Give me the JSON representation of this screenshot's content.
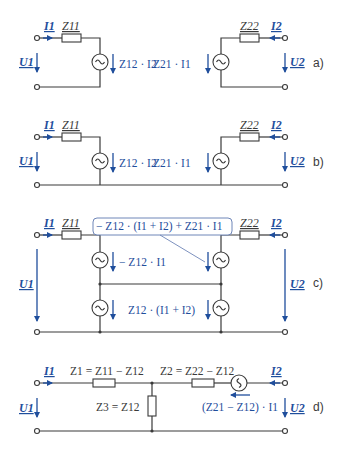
{
  "figure": {
    "colors": {
      "wire": "#3a3a3a",
      "accent": "#1f4e9c",
      "callout_border": "#6f86b8"
    },
    "parts": [
      {
        "id": "a",
        "label": "a)",
        "I1": "I1",
        "I2": "I2",
        "U1": "U1",
        "U2": "U2",
        "Z11": "Z11",
        "Z22": "Z22",
        "left_source": "Z12 · I2",
        "right_source": "Z21 · I1"
      },
      {
        "id": "b",
        "label": "b)",
        "I1": "I1",
        "I2": "I2",
        "U1": "U1",
        "U2": "U2",
        "Z11": "Z11",
        "Z22": "Z22",
        "left_source": "Z12 · I2",
        "right_source": "Z21 · I1"
      },
      {
        "id": "c",
        "label": "c)",
        "I1": "I1",
        "I2": "I2",
        "U1": "U1",
        "U2": "U2",
        "Z11": "Z11",
        "Z22": "Z22",
        "upper_left_source": "− Z12 · I1",
        "lower_source": "Z12 · (I1 + I2)",
        "callout": "− Z12 · (I1 + I2) + Z21 · I1"
      },
      {
        "id": "d",
        "label": "d)",
        "I1": "I1",
        "I2": "I2",
        "U1": "U1",
        "U2": "U2",
        "Z1": "Z1 = Z11 − Z12",
        "Z2": "Z2 = Z22 − Z12",
        "Z3": "Z3 = Z12",
        "source": "(Z21 − Z12) · I1"
      }
    ]
  }
}
